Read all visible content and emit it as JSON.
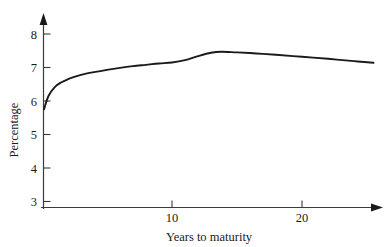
{
  "chart_data": {
    "type": "line",
    "title": "",
    "xlabel": "Years to maturity",
    "ylabel": "Percentage",
    "xlim": [
      0,
      26
    ],
    "ylim": [
      2.7,
      8.4
    ],
    "xticks": [
      10,
      20
    ],
    "xtick_labels": [
      "10",
      "20"
    ],
    "yticks": [
      3,
      4,
      5,
      6,
      7,
      8
    ],
    "ytick_labels": [
      "3",
      "4",
      "5",
      "6",
      "7",
      "8"
    ],
    "grid": false,
    "legend": "none",
    "line_color": "#1a1a1a",
    "axis_color": "#3a3a3a",
    "series": [
      {
        "name": "Yield curve",
        "x": [
          0.15,
          0.5,
          1.0,
          1.5,
          2.0,
          2.5,
          3.0,
          4.0,
          5.0,
          6.0,
          7.0,
          8.0,
          9.0,
          10.0,
          11.0,
          12.0,
          13.0,
          13.8,
          15.0,
          16.5,
          18.0,
          20.0,
          22.0,
          24.0,
          25.5
        ],
        "y": [
          5.75,
          6.15,
          6.42,
          6.56,
          6.65,
          6.72,
          6.78,
          6.86,
          6.93,
          6.99,
          7.04,
          7.08,
          7.12,
          7.15,
          7.22,
          7.34,
          7.44,
          7.47,
          7.45,
          7.42,
          7.38,
          7.32,
          7.26,
          7.19,
          7.14
        ]
      }
    ]
  },
  "axis_labels": {
    "x_title": "Years to maturity",
    "y_title": "Percentage"
  },
  "ticks": {
    "y": [
      "8",
      "7",
      "6",
      "5",
      "4",
      "3"
    ],
    "x": [
      "10",
      "20"
    ]
  }
}
